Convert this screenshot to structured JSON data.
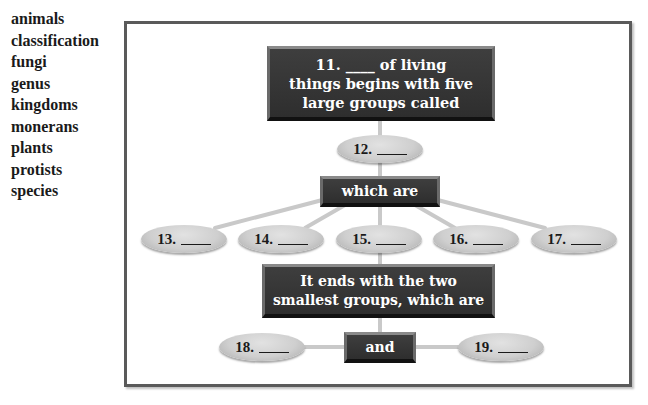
{
  "word_bank": [
    "animals",
    "classification",
    "fungi",
    "genus",
    "kingdoms",
    "monerans",
    "plants",
    "protists",
    "species"
  ],
  "diagram": {
    "top_box": {
      "line1": "11. ____ of living",
      "line2": "things begins with five",
      "line3": "large groups called"
    },
    "which_box": "which are",
    "ends_box": {
      "line1": "It ends with the two",
      "line2": "smallest groups, which are"
    },
    "and_box": "and",
    "blanks": {
      "b12": "12.",
      "b13": "13.",
      "b14": "14.",
      "b15": "15.",
      "b16": "16.",
      "b17": "17.",
      "b18": "18.",
      "b19": "19."
    }
  },
  "colors": {
    "box_fill": "#333333",
    "box_text": "#ffffff",
    "oval_fill": "#cfcfcf",
    "connector": "#c9c9c9",
    "frame": "#5a5a5a"
  }
}
